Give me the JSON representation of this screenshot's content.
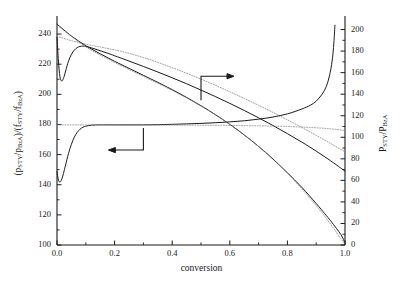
{
  "figure": {
    "background": "#ffffff",
    "line_color": "#1a1a1a",
    "dotted_color": "#8a8a8a"
  },
  "axis_titles": {
    "x": "conversion",
    "y_left_parts": [
      "(p",
      "STY",
      "/p",
      "BzA",
      ")/(f",
      "STY",
      "/f",
      "BzA",
      ")"
    ],
    "y_right_parts": [
      "P",
      "STY",
      "/P",
      "BzA"
    ]
  },
  "ticks": {
    "x_labels": [
      "0.0",
      "0.2",
      "0.4",
      "0.6",
      "0.8",
      "1.0"
    ],
    "x_values": [
      0.0,
      0.2,
      0.4,
      0.6,
      0.8,
      1.0
    ],
    "y_left_labels": [
      "100",
      "120",
      "140",
      "160",
      "180",
      "200",
      "220",
      "240"
    ],
    "y_left_values": [
      100,
      120,
      140,
      160,
      180,
      200,
      220,
      240
    ],
    "y_right_labels": [
      "0",
      "20",
      "40",
      "60",
      "80",
      "100",
      "120",
      "140",
      "160",
      "180",
      "200"
    ],
    "y_right_values": [
      0,
      20,
      40,
      60,
      80,
      100,
      120,
      140,
      160,
      180,
      200
    ]
  },
  "annotations": {
    "arrow_right": {
      "label": "arrow-to-right-axis",
      "x": 0.5,
      "y_left": 212
    },
    "arrow_left": {
      "label": "arrow-to-left-axis",
      "x": 0.3,
      "y_left": 163
    }
  },
  "chart_data": {
    "type": "line",
    "title": "",
    "xlabel": "conversion",
    "ylabel": "(pSTY/pBzA)/(fSTY/fBzA)",
    "ylabel_right": "PSTY/PBzA",
    "xlim": [
      0.0,
      1.0
    ],
    "ylim_left": [
      100,
      248
    ],
    "ylim_right": [
      0,
      207
    ],
    "grid": false,
    "legend": "none",
    "series": [
      {
        "name": "ratio-solid-left-axis",
        "axis": "left",
        "style": "solid",
        "x": [
          0.0,
          0.005,
          0.01,
          0.015,
          0.02,
          0.025,
          0.03,
          0.035,
          0.04,
          0.05,
          0.06,
          0.07,
          0.08,
          0.09,
          0.1,
          0.12,
          0.14,
          0.16,
          0.18,
          0.2,
          0.25,
          0.3,
          0.35,
          0.4,
          0.45,
          0.5,
          0.55,
          0.6,
          0.65,
          0.7,
          0.75,
          0.8,
          0.85,
          0.9,
          0.93,
          0.95,
          0.97,
          0.985,
          1.0
        ],
        "y": [
          238.0,
          222.0,
          212.0,
          209.0,
          209.5,
          212.0,
          215.5,
          219.0,
          222.0,
          226.5,
          229.3,
          231.0,
          231.8,
          232.0,
          231.8,
          230.8,
          229.6,
          228.3,
          227.0,
          225.6,
          222.1,
          218.5,
          214.8,
          211.0,
          207.0,
          202.8,
          198.5,
          194.0,
          189.3,
          184.4,
          179.3,
          173.9,
          168.3,
          162.3,
          158.5,
          155.9,
          153.2,
          151.1,
          149.0
        ]
      },
      {
        "name": "ratio-dotted-left-axis",
        "axis": "left",
        "style": "dotted",
        "x": [
          0.0,
          0.05,
          0.1,
          0.15,
          0.2,
          0.25,
          0.3,
          0.35,
          0.4,
          0.45,
          0.5,
          0.55,
          0.6,
          0.65,
          0.7,
          0.75,
          0.8,
          0.85,
          0.9,
          0.95,
          1.0
        ],
        "y": [
          238.5,
          235.6,
          233.3,
          231.4,
          229.5,
          227.2,
          224.4,
          221.2,
          217.7,
          214.0,
          210.1,
          206.0,
          201.7,
          197.3,
          192.7,
          188.0,
          183.1,
          178.0,
          172.8,
          167.4,
          161.8
        ]
      },
      {
        "name": "pressure-ratio-solid-right-axis",
        "axis": "right",
        "style": "solid",
        "x": [
          0.0,
          0.005,
          0.01,
          0.015,
          0.02,
          0.025,
          0.03,
          0.04,
          0.05,
          0.06,
          0.07,
          0.08,
          0.09,
          0.1,
          0.12,
          0.15,
          0.2,
          0.25,
          0.3,
          0.35,
          0.4,
          0.45,
          0.5,
          0.55,
          0.6,
          0.65,
          0.7,
          0.75,
          0.8,
          0.85,
          0.88,
          0.9,
          0.92,
          0.935,
          0.945,
          0.952,
          0.958,
          0.962,
          0.965
        ],
        "y": [
          68.0,
          60.2,
          58.5,
          60.0,
          64.0,
          69.0,
          74.5,
          85.0,
          93.5,
          100.0,
          104.5,
          107.5,
          109.3,
          110.3,
          111.2,
          111.5,
          111.5,
          111.5,
          111.5,
          111.7,
          112.0,
          112.4,
          112.9,
          113.5,
          114.3,
          115.3,
          116.8,
          118.8,
          121.7,
          126.2,
          129.8,
          133.5,
          139.8,
          147.0,
          156.0,
          165.0,
          177.0,
          190.0,
          204.0
        ]
      },
      {
        "name": "pressure-ratio-dotted-right-axis",
        "axis": "right",
        "style": "dotted",
        "x": [
          0.0,
          0.05,
          0.1,
          0.2,
          0.3,
          0.4,
          0.5,
          0.6,
          0.7,
          0.8,
          0.9,
          0.95,
          1.0
        ],
        "y": [
          111.5,
          111.5,
          111.5,
          111.5,
          111.4,
          111.3,
          111.2,
          111.0,
          110.6,
          110.0,
          108.8,
          107.8,
          106.4
        ]
      },
      {
        "name": "declining-solid-right-axis",
        "axis": "right",
        "style": "solid",
        "x": [
          0.0,
          0.05,
          0.1,
          0.15,
          0.2,
          0.25,
          0.3,
          0.35,
          0.4,
          0.45,
          0.5,
          0.55,
          0.6,
          0.65,
          0.7,
          0.75,
          0.8,
          0.85,
          0.9,
          0.93,
          0.95,
          0.97,
          0.985,
          0.995,
          1.0
        ],
        "y": [
          205.0,
          194.0,
          185.0,
          177.5,
          170.5,
          164.0,
          157.5,
          151.0,
          144.2,
          137.0,
          129.3,
          121.0,
          112.0,
          102.2,
          91.5,
          79.8,
          67.0,
          53.5,
          38.5,
          29.0,
          22.5,
          15.5,
          10.0,
          5.0,
          1.5
        ]
      },
      {
        "name": "declining-dotted-right-axis",
        "axis": "right",
        "style": "dotted",
        "x": [
          0.0,
          0.1,
          0.2,
          0.3,
          0.4,
          0.5,
          0.6,
          0.7,
          0.8,
          0.87,
          0.92,
          0.96,
          0.985,
          1.0
        ],
        "y": [
          204.0,
          184.0,
          169.5,
          156.5,
          143.5,
          129.0,
          112.0,
          91.5,
          66.5,
          46.0,
          30.0,
          15.5,
          6.0,
          1.0
        ]
      }
    ]
  }
}
